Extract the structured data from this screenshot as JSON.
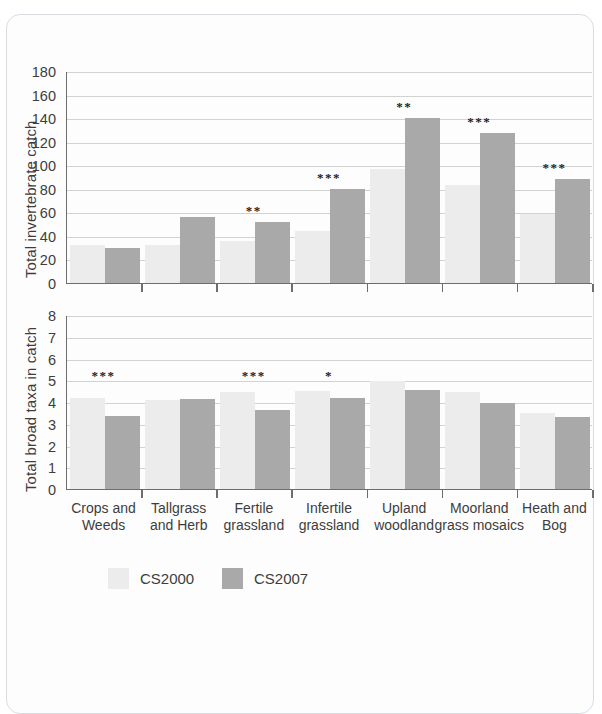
{
  "figure": {
    "legend": [
      {
        "label": "CS2000",
        "color": "#ececec"
      },
      {
        "label": "CS2007",
        "color": "#a9a9a9"
      }
    ],
    "categories_display": [
      "Crops and\nWeeds",
      "Tallgrass\nand Herb",
      "Fertile\ngrassland",
      "Infertile\ngrassland",
      "Upland\nwoodland",
      "Moorland\ngrass mosaics",
      "Heath and\nBog"
    ]
  },
  "chart_data": [
    {
      "type": "bar",
      "title": "",
      "xlabel": "",
      "ylabel": "Total invertebrate catch",
      "ylim": [
        0,
        180
      ],
      "yticks": [
        0,
        20,
        40,
        60,
        80,
        100,
        120,
        140,
        160,
        180
      ],
      "grid": true,
      "legend_position": "bottom",
      "categories": [
        "Crops and Weeds",
        "Tallgrass and Herb",
        "Fertile grassland",
        "Infertile grassland",
        "Upland woodland",
        "Moorland grass mosaics",
        "Heath and Bog"
      ],
      "series": [
        {
          "name": "CS2000",
          "color": "#ececec",
          "values": [
            32,
            32,
            36,
            44,
            97,
            83,
            59
          ]
        },
        {
          "name": "CS2007",
          "color": "#a9a9a9",
          "values": [
            30,
            56,
            52,
            80,
            140,
            127,
            88
          ]
        }
      ],
      "annotations": [
        "",
        "",
        "**",
        "***",
        "**",
        "***",
        "***"
      ]
    },
    {
      "type": "bar",
      "title": "",
      "xlabel": "",
      "ylabel": "Total broad taxa in catch",
      "ylim": [
        0,
        8
      ],
      "yticks": [
        0,
        1,
        2,
        3,
        4,
        5,
        6,
        7,
        8
      ],
      "grid": true,
      "legend_position": "bottom",
      "categories": [
        "Crops and Weeds",
        "Tallgrass and Herb",
        "Fertile grassland",
        "Infertile grassland",
        "Upland woodland",
        "Moorland grass mosaics",
        "Heath and Bog"
      ],
      "series": [
        {
          "name": "CS2000",
          "color": "#ececec",
          "values": [
            4.2,
            4.1,
            4.45,
            4.5,
            4.95,
            4.45,
            3.5
          ]
        },
        {
          "name": "CS2007",
          "color": "#a9a9a9",
          "values": [
            3.35,
            4.15,
            3.65,
            4.2,
            4.55,
            3.95,
            3.3
          ]
        }
      ],
      "annotations": [
        "***",
        "",
        "***",
        "*",
        "",
        "",
        ""
      ]
    }
  ]
}
